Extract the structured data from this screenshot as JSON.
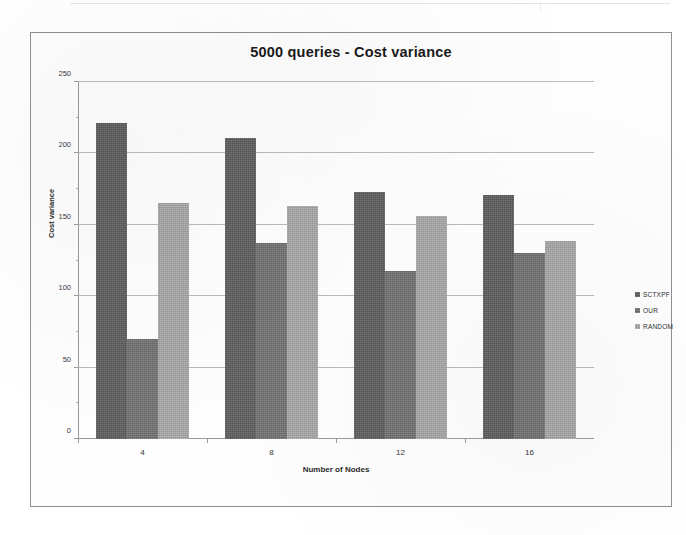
{
  "chart_data": {
    "type": "bar",
    "title": "5000 queries - Cost variance",
    "xlabel": "Number of Nodes",
    "ylabel": "Cost variance",
    "categories": [
      "4",
      "8",
      "12",
      "16"
    ],
    "ylim": [
      0,
      250
    ],
    "yticks": [
      0,
      50,
      100,
      150,
      200,
      250
    ],
    "grid": true,
    "legend_position": "right",
    "series": [
      {
        "name": "SCTXPF",
        "color": "#595959",
        "values": [
          221,
          211,
          173,
          171
        ]
      },
      {
        "name": "OUR",
        "color": "#6e6e6e",
        "values": [
          70,
          137,
          118,
          130
        ]
      },
      {
        "name": "RANDOM",
        "color": "#a6a6a6",
        "values": [
          165,
          163,
          156,
          139
        ]
      }
    ]
  }
}
